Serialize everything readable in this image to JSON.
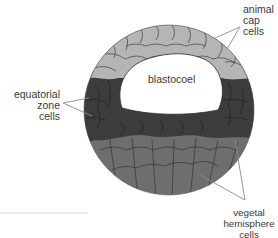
{
  "diagram": {
    "regions": [
      {
        "id": "animal-cap",
        "label_lines": [
          "animal",
          "cap",
          "cells"
        ],
        "color": "#b5b5b5"
      },
      {
        "id": "equatorial-zone",
        "label_lines": [
          "equatorial",
          "zone",
          "cells"
        ],
        "color": "#3c3c3c"
      },
      {
        "id": "vegetal-hemisphere",
        "label_lines": [
          "vegetal",
          "hemisphere",
          "cells"
        ],
        "color": "#6e6e6e"
      },
      {
        "id": "blastocoel",
        "label": "blastocoel",
        "color": "#ffffff"
      }
    ],
    "cell_outline_color": "#2a2a2a",
    "leader_line_color": "#8a8a8a"
  }
}
